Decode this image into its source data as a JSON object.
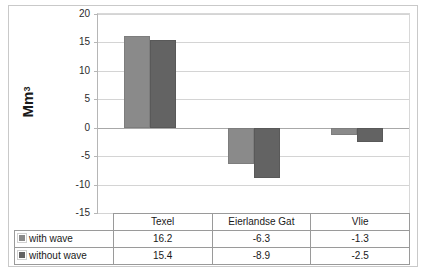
{
  "chart_data": {
    "type": "bar",
    "title": "",
    "xlabel": "",
    "ylabel": "Mm3",
    "ylabel_base": "Mm",
    "ylabel_exponent": "3",
    "categories": [
      "Texel",
      "Eierlandse Gat",
      "Vlie"
    ],
    "series": [
      {
        "name": "with wave",
        "values": [
          16.2,
          -6.3,
          -1.3
        ],
        "color": "#8a8a8a"
      },
      {
        "name": "without wave",
        "values": [
          15.4,
          -8.9,
          -2.5
        ],
        "color": "#636363"
      }
    ],
    "ylim": [
      -15,
      20
    ],
    "yticks": [
      "20",
      "15",
      "10",
      "5",
      "0",
      "-5",
      "-10",
      "-15"
    ],
    "ytick_values": [
      20,
      15,
      10,
      5,
      0,
      -5,
      -10,
      -15
    ],
    "grid": true,
    "legend_position": "table",
    "has_data_table": true
  },
  "table": {
    "column_headers": [
      "Texel",
      "Eierlandse Gat",
      "Vlie"
    ],
    "rows": [
      {
        "label": "with wave",
        "swatch": "legend-swatch-light",
        "cells": [
          "16.2",
          "-6.3",
          "-1.3"
        ]
      },
      {
        "label": "without wave",
        "swatch": "legend-swatch-dark",
        "cells": [
          "15.4",
          "-8.9",
          "-2.5"
        ]
      }
    ]
  }
}
